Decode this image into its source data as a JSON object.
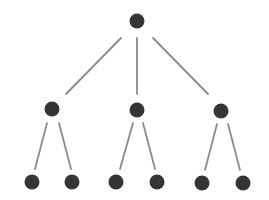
{
  "diagram": {
    "type": "tree",
    "levels": 3,
    "branching": [
      3,
      2
    ],
    "colors": {
      "node": "#353535",
      "edge": "#8a8a8a",
      "background": "#ffffff"
    },
    "node_radius": 7.5,
    "nodes": [
      {
        "id": "root",
        "level": 0,
        "x": 137,
        "y": 21
      },
      {
        "id": "n1",
        "level": 1,
        "x": 52,
        "y": 109
      },
      {
        "id": "n2",
        "level": 1,
        "x": 137,
        "y": 110
      },
      {
        "id": "n3",
        "level": 1,
        "x": 221,
        "y": 111
      },
      {
        "id": "n1a",
        "level": 2,
        "x": 32,
        "y": 182
      },
      {
        "id": "n1b",
        "level": 2,
        "x": 72,
        "y": 182
      },
      {
        "id": "n2a",
        "level": 2,
        "x": 116,
        "y": 182
      },
      {
        "id": "n2b",
        "level": 2,
        "x": 157,
        "y": 182
      },
      {
        "id": "n3a",
        "level": 2,
        "x": 202,
        "y": 183
      },
      {
        "id": "n3b",
        "level": 2,
        "x": 243,
        "y": 183
      }
    ],
    "edges": [
      {
        "from": "root",
        "to": "n1",
        "x1": 121,
        "y1": 38,
        "x2": 66,
        "y2": 94
      },
      {
        "from": "root",
        "to": "n2",
        "x1": 137,
        "y1": 38,
        "x2": 137,
        "y2": 94
      },
      {
        "from": "root",
        "to": "n3",
        "x1": 153,
        "y1": 38,
        "x2": 208,
        "y2": 94
      },
      {
        "from": "n1",
        "to": "n1a",
        "x1": 47,
        "y1": 123,
        "x2": 35,
        "y2": 169
      },
      {
        "from": "n1",
        "to": "n1b",
        "x1": 59,
        "y1": 123,
        "x2": 71,
        "y2": 169
      },
      {
        "from": "n2",
        "to": "n2a",
        "x1": 133,
        "y1": 123,
        "x2": 120,
        "y2": 169
      },
      {
        "from": "n2",
        "to": "n2b",
        "x1": 143,
        "y1": 123,
        "x2": 155,
        "y2": 169
      },
      {
        "from": "n3",
        "to": "n3a",
        "x1": 217,
        "y1": 124,
        "x2": 205,
        "y2": 170
      },
      {
        "from": "n3",
        "to": "n3b",
        "x1": 228,
        "y1": 124,
        "x2": 240,
        "y2": 170
      }
    ]
  }
}
